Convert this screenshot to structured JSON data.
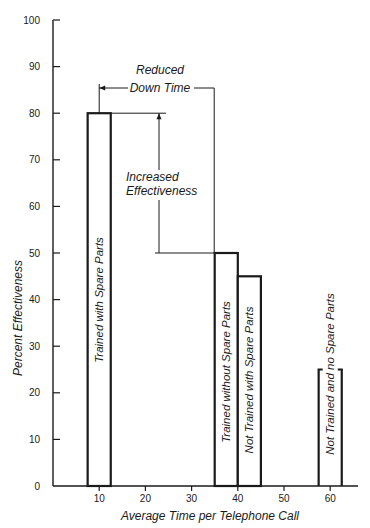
{
  "chart_data": {
    "type": "bar",
    "title": "",
    "xlabel": "Average Time per Telephone Call",
    "ylabel": "Percent Effectiveness",
    "xlim": [
      0,
      65
    ],
    "ylim": [
      0,
      100
    ],
    "xticks": [
      10,
      20,
      30,
      40,
      50,
      60
    ],
    "yticks": [
      0,
      10,
      20,
      30,
      40,
      50,
      60,
      70,
      80,
      90,
      100
    ],
    "grid": false,
    "legend": null,
    "bars": [
      {
        "label": "Trained with Spare Parts",
        "x_start": 7.5,
        "x_end": 12.5,
        "x_center": 10,
        "value": 80
      },
      {
        "label": "Trained without Spare Parts",
        "x_start": 35,
        "x_end": 40,
        "x_center": 37.5,
        "value": 50
      },
      {
        "label": "Not Trained with Spare Parts",
        "x_start": 40,
        "x_end": 45,
        "x_center": 42.5,
        "value": 45
      },
      {
        "label": "Not Trained and no Spare Parts",
        "x_start": 57.5,
        "x_end": 62.5,
        "x_center": 60,
        "value": 25
      }
    ],
    "categories": [
      "Trained with Spare Parts",
      "Trained without Spare Parts",
      "Not Trained with Spare Parts",
      "Not Trained and no Spare Parts"
    ],
    "values": [
      80,
      50,
      45,
      25
    ],
    "annotations": [
      {
        "text": [
          "Reduced",
          "Down Time"
        ],
        "type": "horizontal-span",
        "from_x": 10,
        "to_x": 37.5,
        "note": "difference in average call time between Trained with Spare Parts and Trained without Spare Parts"
      },
      {
        "text": [
          "Increased",
          "Effectiveness"
        ],
        "type": "vertical-span",
        "from_y": 50,
        "to_y": 80,
        "x": 22
      }
    ]
  }
}
